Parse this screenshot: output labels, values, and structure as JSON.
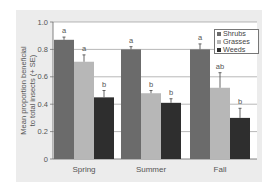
{
  "chart_data": {
    "type": "bar",
    "title": "",
    "xlabel": "",
    "ylabel": "Mean proportion beneficial to total insects (+ SE)",
    "ylabel_lines": [
      "Mean proportion beneficial",
      "to total insects (+ SE)"
    ],
    "ylim": [
      0,
      1.0
    ],
    "yticks": [
      "0",
      "0.2",
      "0.4",
      "0.6",
      "0.8",
      "1.0"
    ],
    "grid": true,
    "legend_position": "top-right",
    "categories": [
      "Spring",
      "Summer",
      "Fall"
    ],
    "series": [
      {
        "name": "Shrubs",
        "color": "#6b6b6b",
        "values": [
          0.87,
          0.8,
          0.8
        ],
        "se": [
          0.02,
          0.02,
          0.04
        ],
        "letters": [
          "a",
          "a",
          "a"
        ]
      },
      {
        "name": "Grasses",
        "color": "#b7b7b7",
        "values": [
          0.71,
          0.48,
          0.52
        ],
        "se": [
          0.05,
          0.02,
          0.11
        ],
        "letters": [
          "a",
          "b",
          "ab"
        ]
      },
      {
        "name": "Weeds",
        "color": "#2e2e2e",
        "values": [
          0.45,
          0.41,
          0.3
        ],
        "se": [
          0.05,
          0.03,
          0.07
        ],
        "letters": [
          "b",
          "b",
          "b"
        ]
      }
    ]
  },
  "legend": {
    "items": [
      {
        "label": "Shrubs",
        "color": "#6b6b6b"
      },
      {
        "label": "Grasses",
        "color": "#b7b7b7"
      },
      {
        "label": "Weeds",
        "color": "#2e2e2e"
      }
    ]
  },
  "axis": {
    "ylabel_line1": "Mean proportion beneficial",
    "ylabel_line2": "to total insects (+ SE)"
  }
}
